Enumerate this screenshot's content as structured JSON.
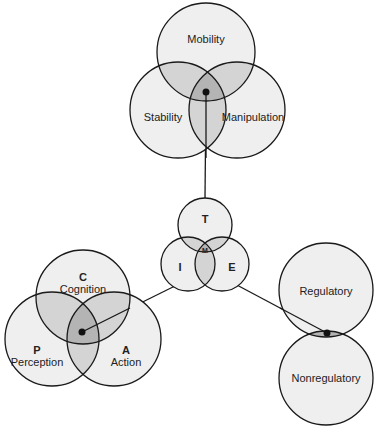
{
  "colors": {
    "circle_fill": "#efefef",
    "overlap_fill": "#d4d4d4",
    "center_fill": "#b4b4b4",
    "stroke": "#1a1a1a"
  },
  "top_group": {
    "mobility": "Mobility",
    "stability": "Stability",
    "manipulation": "Manipulation"
  },
  "center_group": {
    "t": "T",
    "i": "I",
    "e": "E",
    "m": "M"
  },
  "left_group": {
    "c_letter": "C",
    "c_label": "Cognition",
    "p_letter": "P",
    "p_label": "Perception",
    "a_letter": "A",
    "a_label": "Action"
  },
  "right_group": {
    "regulatory": "Regulatory",
    "nonregulatory": "Nonregulatory"
  }
}
